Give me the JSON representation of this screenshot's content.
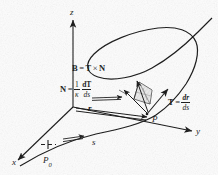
{
  "figure": {
    "style": {
      "ink": "#111111",
      "paper": "#fdfdfd",
      "shade": "#cfcfcf"
    }
  },
  "axes": {
    "z": {
      "label": "z"
    },
    "y": {
      "label": "y"
    },
    "x": {
      "label": "x"
    }
  },
  "points": {
    "P": {
      "label": "P"
    },
    "P0": {
      "label": "P",
      "subscript": "0"
    }
  },
  "arc": {
    "label": "s"
  },
  "position_vector": {
    "label": "r"
  },
  "equations": {
    "binormal": {
      "lhs": "B",
      "eq": "=",
      "rhs_first": "T",
      "cross": "×",
      "rhs_second": "N"
    },
    "normal": {
      "lhs": "N",
      "eq": "=",
      "coef_num": "1",
      "coef_den": "κ",
      "frac_num": "dT",
      "frac_den": "ds"
    },
    "tangent": {
      "lhs": "T",
      "eq": "=",
      "frac_num": "dr",
      "frac_den": "ds"
    }
  }
}
